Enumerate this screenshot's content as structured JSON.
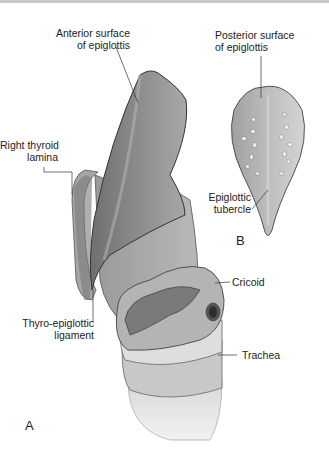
{
  "figure": {
    "panels": [
      "A",
      "B"
    ],
    "labels": {
      "anterior_surface": [
        "Anterior surface",
        "of epiglottis"
      ],
      "posterior_surface": [
        "Posterior surface",
        "of epiglottis"
      ],
      "right_thyroid_lamina": [
        "Right thyroid",
        "lamina"
      ],
      "epiglottic_tubercle": [
        "Epiglottic",
        "tubercle"
      ],
      "cricoid": "Cricoid",
      "thyro_epiglottic_ligament": [
        "Thyro-epiglottic",
        "ligament"
      ],
      "trachea": "Trachea"
    }
  }
}
